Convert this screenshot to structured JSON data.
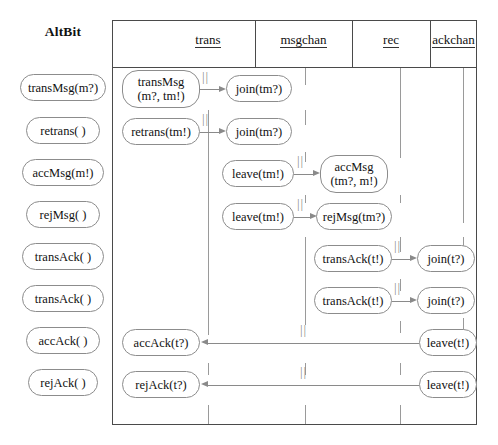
{
  "title": "AltBit",
  "diagram": {
    "type": "uml-sequence-refinement-table",
    "columns": [
      {
        "name": "trans",
        "label": "trans",
        "center_x": 208
      },
      {
        "name": "msgchan",
        "label": "msgchan",
        "center_x": 305
      },
      {
        "name": "rec",
        "label": "rec",
        "center_x": 400
      },
      {
        "name": "ackchan",
        "label": "ackchan",
        "center_x": 463
      }
    ],
    "abstract_actions": [
      {
        "label": "transMsg(m?)",
        "row": 1
      },
      {
        "label": "retrans( )",
        "row": 2
      },
      {
        "label": "accMsg(m!)",
        "row": 3
      },
      {
        "label": "rejMsg( )",
        "row": 4
      },
      {
        "label": "transAck( )",
        "row": 5
      },
      {
        "label": "transAck( )",
        "row": 6
      },
      {
        "label": "accAck( )",
        "row": 7
      },
      {
        "label": "rejAck( )",
        "row": 8
      }
    ],
    "rows": [
      {
        "row": 1,
        "source": {
          "label_line1": "transMsg",
          "label_line2": "(m?, tm!)",
          "column": "trans"
        },
        "target": {
          "label_line1": "join(tm?)",
          "label_line2": "",
          "column": "msgchan"
        },
        "direction": "right",
        "sync_marker": "||"
      },
      {
        "row": 2,
        "source": {
          "label_line1": "retrans(tm!)",
          "label_line2": "",
          "column": "trans"
        },
        "target": {
          "label_line1": "join(tm?)",
          "label_line2": "",
          "column": "msgchan"
        },
        "direction": "right",
        "sync_marker": "||"
      },
      {
        "row": 3,
        "source": {
          "label_line1": "leave(tm!)",
          "label_line2": "",
          "column": "msgchan"
        },
        "target": {
          "label_line1": "accMsg",
          "label_line2": "(tm?, m!)",
          "column": "rec"
        },
        "direction": "right",
        "sync_marker": "||"
      },
      {
        "row": 4,
        "source": {
          "label_line1": "leave(tm!)",
          "label_line2": "",
          "column": "msgchan"
        },
        "target": {
          "label_line1": "rejMsg(tm?)",
          "label_line2": "",
          "column": "rec"
        },
        "direction": "right",
        "sync_marker": "||"
      },
      {
        "row": 5,
        "source": {
          "label_line1": "transAck(t!)",
          "label_line2": "",
          "column": "rec"
        },
        "target": {
          "label_line1": "join(t?)",
          "label_line2": "",
          "column": "ackchan"
        },
        "direction": "right",
        "sync_marker": "||"
      },
      {
        "row": 6,
        "source": {
          "label_line1": "transAck(t!)",
          "label_line2": "",
          "column": "rec"
        },
        "target": {
          "label_line1": "join(t?)",
          "label_line2": "",
          "column": "ackchan"
        },
        "direction": "right",
        "sync_marker": "||"
      },
      {
        "row": 7,
        "source": {
          "label_line1": "leave(t!)",
          "label_line2": "",
          "column": "ackchan"
        },
        "target": {
          "label_line1": "accAck(t?)",
          "label_line2": "",
          "column": "trans"
        },
        "direction": "left",
        "sync_marker": "||"
      },
      {
        "row": 8,
        "source": {
          "label_line1": "leave(t!)",
          "label_line2": "",
          "column": "ackchan"
        },
        "target": {
          "label_line1": "rejAck(t?)",
          "label_line2": "",
          "column": "trans"
        },
        "direction": "left",
        "sync_marker": "||"
      }
    ],
    "colors": {
      "frame": "#4a4a4a",
      "capsule_border": "#8c8c8c",
      "arrow": "#8a8a8a",
      "lifeline": "#9a9a9a",
      "text": "#111111",
      "background": "#ffffff"
    }
  }
}
